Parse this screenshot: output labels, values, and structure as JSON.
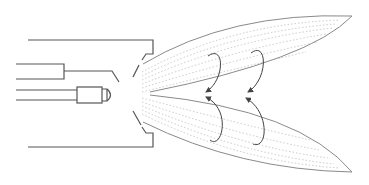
{
  "diagram": {
    "title": "",
    "labels": [],
    "colors": {
      "outline": "#555555",
      "lobe_outline": "#8a8a8a",
      "flow_dots": "#bdbdbd",
      "arrows": "#444444",
      "background": "#ffffff"
    },
    "components": [
      {
        "name": "housing",
        "type": "open-box"
      },
      {
        "name": "upper-pipe",
        "type": "tube-with-bent-lead"
      },
      {
        "name": "injector-nozzle",
        "type": "cylinder-with-dome-tip"
      },
      {
        "name": "upper-flap",
        "type": "angled-lip"
      },
      {
        "name": "lower-flap",
        "type": "angled-lip"
      },
      {
        "name": "upper-spray-lobe",
        "type": "leaf-shaped-plume"
      },
      {
        "name": "lower-spray-lobe",
        "type": "leaf-shaped-plume"
      },
      {
        "name": "recirculation-arrows",
        "type": "curved-arrows",
        "count": 4
      }
    ]
  }
}
